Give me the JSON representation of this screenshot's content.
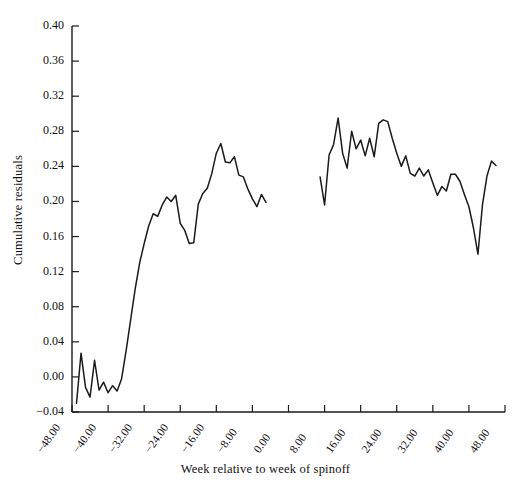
{
  "chart_data": {
    "type": "line",
    "title": "",
    "xlabel": "Week relative to week of spinoff",
    "ylabel": "Cumulative residuals",
    "xlim": [
      -48,
      48
    ],
    "ylim": [
      -0.04,
      0.4
    ],
    "grid": false,
    "legend": "none",
    "xticks": [
      -48,
      -40,
      -32,
      -24,
      -16,
      -8,
      0,
      8,
      16,
      24,
      32,
      40,
      48
    ],
    "xtick_labels": [
      "-48.00",
      "-40.00",
      "-32.00",
      "-24.00",
      "-16.00",
      "-8.00",
      "0.00",
      "8.00",
      "16.00",
      "24.00",
      "32.00",
      "40.00",
      "48.00"
    ],
    "yticks": [
      -0.04,
      0.0,
      0.04,
      0.08,
      0.12,
      0.16,
      0.2,
      0.24,
      0.28,
      0.32,
      0.36,
      0.4
    ],
    "ytick_labels": [
      "-0.04",
      "0.00",
      "0.04",
      "0.08",
      "0.12",
      "0.16",
      "0.20",
      "0.24",
      "0.28",
      "0.32",
      "0.36",
      "0.40"
    ],
    "line_color": "#1a1a1a",
    "series": [
      {
        "name": "pre-spinoff cumulative residuals",
        "x": [
          -47,
          -46,
          -45,
          -44,
          -43,
          -42,
          -41,
          -40,
          -39,
          -38,
          -37,
          -36,
          -35,
          -34,
          -33,
          -32,
          -31,
          -30,
          -29,
          -28,
          -27,
          -26,
          -25,
          -24,
          -23,
          -22,
          -21,
          -20,
          -19,
          -18,
          -17,
          -16,
          -15,
          -14,
          -13,
          -12,
          -11,
          -10,
          -9,
          -8,
          -7,
          -6,
          -5
        ],
        "y": [
          -0.03,
          0.027,
          -0.012,
          -0.023,
          0.019,
          -0.015,
          -0.006,
          -0.018,
          -0.01,
          -0.016,
          -0.002,
          0.03,
          0.065,
          0.1,
          0.13,
          0.152,
          0.172,
          0.186,
          0.183,
          0.196,
          0.205,
          0.2,
          0.207,
          0.175,
          0.167,
          0.152,
          0.153,
          0.197,
          0.209,
          0.215,
          0.232,
          0.255,
          0.266,
          0.245,
          0.244,
          0.251,
          0.23,
          0.228,
          0.214,
          0.203,
          0.194,
          0.208,
          0.199
        ]
      },
      {
        "name": "post-spinoff cumulative residuals",
        "x": [
          7,
          8,
          9,
          10,
          11,
          12,
          13,
          14,
          15,
          16,
          17,
          18,
          19,
          20,
          21,
          22,
          23,
          24,
          25,
          26,
          27,
          28,
          29,
          30,
          31,
          32,
          33,
          34,
          35,
          36,
          37,
          38,
          39,
          40,
          41,
          42,
          43,
          44,
          45,
          46
        ],
        "y": [
          0.228,
          0.196,
          0.253,
          0.265,
          0.295,
          0.255,
          0.238,
          0.28,
          0.26,
          0.27,
          0.252,
          0.272,
          0.251,
          0.289,
          0.293,
          0.291,
          0.272,
          0.255,
          0.24,
          0.252,
          0.232,
          0.229,
          0.238,
          0.229,
          0.236,
          0.221,
          0.207,
          0.217,
          0.212,
          0.231,
          0.231,
          0.223,
          0.208,
          0.194,
          0.17,
          0.14,
          0.196,
          0.229,
          0.246,
          0.241
        ]
      }
    ]
  }
}
